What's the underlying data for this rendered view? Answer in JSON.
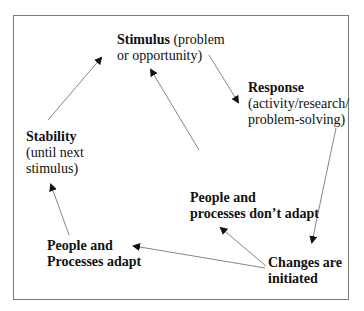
{
  "diagram": {
    "nodes": {
      "stimulus": {
        "bold": "Stimulus",
        "rest_line1": " (problem",
        "line2": "or opportunity)"
      },
      "response": {
        "bold": "Response",
        "line2": "(activity/research/",
        "line3": "problem-solving)"
      },
      "stability": {
        "bold": "Stability",
        "line2": "(until next",
        "line3": "stimulus)"
      },
      "dont_adapt": {
        "line1": "People and",
        "line2": "processes don’t adapt"
      },
      "adapt": {
        "line1": "People and",
        "line2": "Processes adapt"
      },
      "changes": {
        "line1": "Changes are",
        "line2": "initiated"
      }
    },
    "edges": [
      {
        "from": "stimulus",
        "to": "response"
      },
      {
        "from": "response",
        "to": "changes"
      },
      {
        "from": "changes",
        "to": "dont_adapt"
      },
      {
        "from": "changes",
        "to": "adapt"
      },
      {
        "from": "dont_adapt",
        "to": "stimulus"
      },
      {
        "from": "adapt",
        "to": "stability"
      },
      {
        "from": "stability",
        "to": "stimulus"
      }
    ],
    "colors": {
      "arrow": "#555555",
      "frame": "#7a7a7a",
      "text": "#111111"
    }
  }
}
